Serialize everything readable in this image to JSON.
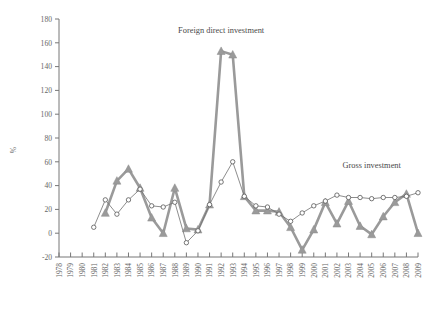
{
  "chart_data": {
    "type": "line",
    "title": "",
    "xlabel": "",
    "ylabel": "%",
    "ylim": [
      -20,
      180
    ],
    "ytick_step": 20,
    "grid": false,
    "legend_position": "inline-annotations",
    "x": [
      1978,
      1979,
      1980,
      1981,
      1982,
      1983,
      1984,
      1985,
      1986,
      1987,
      1988,
      1989,
      1990,
      1991,
      1992,
      1993,
      1994,
      1995,
      1996,
      1997,
      1998,
      1999,
      2000,
      2001,
      2002,
      2003,
      2004,
      2005,
      2006,
      2007,
      2008,
      2009
    ],
    "xtick_labels": [
      "1978",
      "1979",
      "1980",
      "1981",
      "1982",
      "1983",
      "1984",
      "1985",
      "1986",
      "1987",
      "1988",
      "1989",
      "1990",
      "1991",
      "1992",
      "1993",
      "1994",
      "1995",
      "1996",
      "1997",
      "1998",
      "1999",
      "2000",
      "2001",
      "2002",
      "2003",
      "2004",
      "2005",
      "2006",
      "2007",
      "2008",
      "2009"
    ],
    "ytick_labels": [
      "-20",
      "0",
      "20",
      "40",
      "60",
      "80",
      "100",
      "120",
      "140",
      "160",
      "180"
    ],
    "series": [
      {
        "name": "Foreign direct investment",
        "marker": "triangle",
        "color": "#9a9a9a",
        "annotation": "Foreign direct investment",
        "values": [
          null,
          null,
          null,
          null,
          17,
          44,
          54,
          38,
          13,
          0,
          38,
          4,
          3,
          24,
          153,
          150,
          31,
          19,
          19,
          18,
          5,
          -14,
          3,
          26,
          8,
          27,
          6,
          -1,
          14,
          26,
          33,
          0
        ]
      },
      {
        "name": "Gross investment",
        "marker": "open-circle",
        "color": "#707070",
        "annotation": "Gross investment",
        "values": [
          null,
          null,
          null,
          5,
          28,
          16,
          28,
          37,
          23,
          22,
          26,
          -8,
          2,
          24,
          43,
          60,
          31,
          23,
          22,
          16,
          10,
          17,
          23,
          27,
          32,
          30,
          30,
          29,
          30,
          30,
          31,
          34
        ]
      }
    ],
    "annotations": [
      {
        "text": "Foreign direct investment",
        "x": 1992,
        "y": 168
      },
      {
        "text": "Gross investment",
        "x": 2005,
        "y": 55
      }
    ]
  }
}
